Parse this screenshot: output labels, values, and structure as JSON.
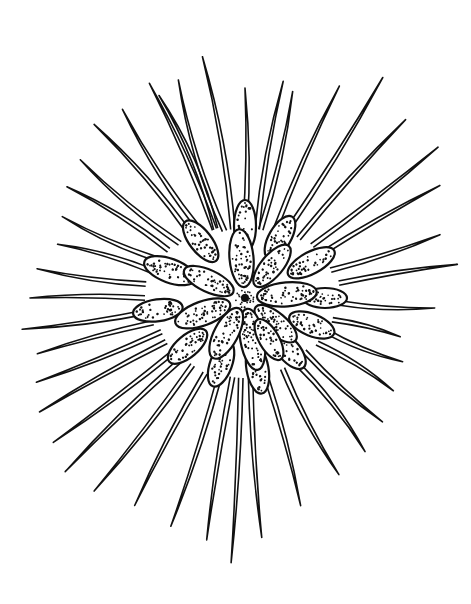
{
  "illustration": {
    "subject": "botanical line drawing of a plant rosette with stippled oval leaves and long radiating needle-like leaves",
    "style": "black ink line art with stippling on white background",
    "colors": {
      "background": "#ffffff",
      "ink": "#111111"
    },
    "center": {
      "x": 245,
      "y": 298
    },
    "needles": [
      {
        "a": -100,
        "r0": 70,
        "r1": 245,
        "bend": 8
      },
      {
        "a": -107,
        "r0": 70,
        "r1": 228,
        "bend": -10
      },
      {
        "a": -113,
        "r0": 75,
        "r1": 220,
        "bend": 12
      },
      {
        "a": -90,
        "r0": 70,
        "r1": 210,
        "bend": 5
      },
      {
        "a": -80,
        "r0": 70,
        "r1": 220,
        "bend": -6
      },
      {
        "a": -77,
        "r0": 70,
        "r1": 212,
        "bend": 6
      },
      {
        "a": -66,
        "r0": 70,
        "r1": 232,
        "bend": -5
      },
      {
        "a": -58,
        "r0": 75,
        "r1": 260,
        "bend": 4
      },
      {
        "a": -48,
        "r0": 80,
        "r1": 240,
        "bend": -4
      },
      {
        "a": -38,
        "r0": 85,
        "r1": 245,
        "bend": 3
      },
      {
        "a": -30,
        "r0": 85,
        "r1": 225,
        "bend": -3
      },
      {
        "a": -18,
        "r0": 90,
        "r1": 205,
        "bend": 4
      },
      {
        "a": -9,
        "r0": 95,
        "r1": 215,
        "bend": -3
      },
      {
        "a": 3,
        "r0": 95,
        "r1": 190,
        "bend": 5
      },
      {
        "a": 14,
        "r0": 90,
        "r1": 160,
        "bend": -4
      },
      {
        "a": 22,
        "r0": 85,
        "r1": 170,
        "bend": 6
      },
      {
        "a": 32,
        "r0": 85,
        "r1": 175,
        "bend": -6
      },
      {
        "a": 42,
        "r0": 80,
        "r1": 185,
        "bend": 5
      },
      {
        "a": 52,
        "r0": 80,
        "r1": 195,
        "bend": -8
      },
      {
        "a": 62,
        "r0": 80,
        "r1": 200,
        "bend": 6
      },
      {
        "a": 75,
        "r0": 80,
        "r1": 215,
        "bend": -4
      },
      {
        "a": 86,
        "r0": 80,
        "r1": 240,
        "bend": 4
      },
      {
        "a": 93,
        "r0": 80,
        "r1": 265,
        "bend": -3
      },
      {
        "a": 99,
        "r0": 80,
        "r1": 245,
        "bend": 3
      },
      {
        "a": 108,
        "r0": 80,
        "r1": 240,
        "bend": -4
      },
      {
        "a": 118,
        "r0": 85,
        "r1": 235,
        "bend": 4
      },
      {
        "a": 128,
        "r0": 85,
        "r1": 245,
        "bend": -4
      },
      {
        "a": 136,
        "r0": 85,
        "r1": 250,
        "bend": 4
      },
      {
        "a": 143,
        "r0": 85,
        "r1": 240,
        "bend": -3
      },
      {
        "a": 151,
        "r0": 90,
        "r1": 235,
        "bend": 3
      },
      {
        "a": 158,
        "r0": 90,
        "r1": 225,
        "bend": -3
      },
      {
        "a": 165,
        "r0": 95,
        "r1": 215,
        "bend": 3
      },
      {
        "a": 172,
        "r0": 95,
        "r1": 225,
        "bend": -4
      },
      {
        "a": 180,
        "r0": 100,
        "r1": 215,
        "bend": 4
      },
      {
        "a": 188,
        "r0": 100,
        "r1": 210,
        "bend": -5
      },
      {
        "a": 196,
        "r0": 95,
        "r1": 195,
        "bend": 6
      },
      {
        "a": 204,
        "r0": 95,
        "r1": 200,
        "bend": -6
      },
      {
        "a": 212,
        "r0": 90,
        "r1": 210,
        "bend": 7
      },
      {
        "a": 220,
        "r0": 85,
        "r1": 215,
        "bend": -7
      },
      {
        "a": 229,
        "r0": 80,
        "r1": 230,
        "bend": 8
      },
      {
        "a": 237,
        "r0": 75,
        "r1": 225,
        "bend": -8
      },
      {
        "a": 246,
        "r0": 75,
        "r1": 235,
        "bend": 6
      }
    ],
    "petals_outer": [
      {
        "a": -90,
        "d": 72,
        "len": 52,
        "w": 22
      },
      {
        "a": -60,
        "d": 70,
        "len": 48,
        "w": 22
      },
      {
        "a": -28,
        "d": 75,
        "len": 52,
        "w": 22
      },
      {
        "a": 0,
        "d": 80,
        "len": 44,
        "w": 20
      },
      {
        "a": 22,
        "d": 72,
        "len": 48,
        "w": 22
      },
      {
        "a": 50,
        "d": 68,
        "len": 46,
        "w": 22
      },
      {
        "a": 80,
        "d": 72,
        "len": 50,
        "w": 22
      },
      {
        "a": 110,
        "d": 70,
        "len": 48,
        "w": 22
      },
      {
        "a": 140,
        "d": 75,
        "len": 48,
        "w": 22
      },
      {
        "a": 172,
        "d": 88,
        "len": 50,
        "w": 22
      },
      {
        "a": 200,
        "d": 80,
        "len": 54,
        "w": 24
      },
      {
        "a": 232,
        "d": 72,
        "len": 50,
        "w": 22
      }
    ],
    "petals_inner": [
      {
        "a": -95,
        "d": 40,
        "len": 58,
        "w": 24
      },
      {
        "a": -50,
        "d": 42,
        "len": 52,
        "w": 22
      },
      {
        "a": -5,
        "d": 42,
        "len": 60,
        "w": 24
      },
      {
        "a": 40,
        "d": 40,
        "len": 52,
        "w": 22
      },
      {
        "a": 80,
        "d": 42,
        "len": 62,
        "w": 24
      },
      {
        "a": 118,
        "d": 40,
        "len": 56,
        "w": 24
      },
      {
        "a": 160,
        "d": 45,
        "len": 58,
        "w": 24
      },
      {
        "a": 205,
        "d": 40,
        "len": 54,
        "w": 22
      },
      {
        "a": 60,
        "d": 48,
        "len": 46,
        "w": 20
      }
    ]
  }
}
